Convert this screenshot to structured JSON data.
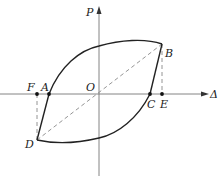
{
  "diagram": {
    "type": "hysteresis-loop",
    "axes": {
      "x_label": "Δ",
      "y_label": "P",
      "origin_label": "O"
    },
    "points": {
      "A": {
        "label": "A",
        "x": 49,
        "y": 94
      },
      "B": {
        "label": "B",
        "x": 162,
        "y": 44
      },
      "C": {
        "label": "C",
        "x": 150,
        "y": 94
      },
      "D": {
        "label": "D",
        "x": 37,
        "y": 140
      },
      "E": {
        "label": "E",
        "x": 162,
        "y": 94
      },
      "F": {
        "label": "F",
        "x": 37,
        "y": 94
      }
    },
    "colors": {
      "curve": "#222222",
      "axis": "#777777",
      "dashed": "#888888"
    }
  }
}
